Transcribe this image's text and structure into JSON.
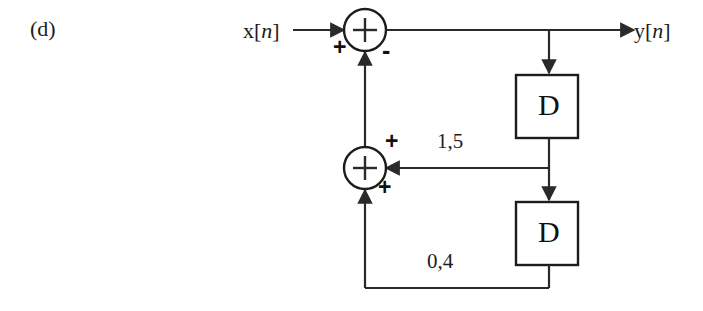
{
  "figure": {
    "part_label": "(d)",
    "type": "signal-flow-block-diagram",
    "background_color": "#ffffff",
    "line_color": "#2a2a2a"
  },
  "signals": {
    "input": {
      "name": "x",
      "index": "n",
      "bracket_open": "[",
      "bracket_close": "]"
    },
    "output": {
      "name": "y",
      "index": "n",
      "bracket_open": "[",
      "bracket_close": "]"
    }
  },
  "adders": {
    "top": {
      "symbol": "+",
      "input_sign_left": "+",
      "input_sign_bottom": "-"
    },
    "middle": {
      "symbol": "+",
      "input_sign_right": "+",
      "input_sign_bottom": "+"
    }
  },
  "delay_blocks": [
    {
      "label": "D"
    },
    {
      "label": "D"
    }
  ],
  "coefficients": [
    {
      "value": "1,5",
      "path": "first-delay-feedback"
    },
    {
      "value": "0,4",
      "path": "second-delay-feedback"
    }
  ]
}
